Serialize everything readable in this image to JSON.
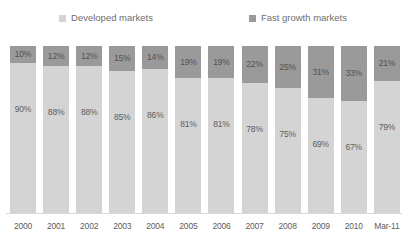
{
  "legend": {
    "position": "top-center",
    "items": [
      {
        "label": "Developed markets",
        "color": "#d4d4d4",
        "swatch_name": "legend-swatch-developed"
      },
      {
        "label": "Fast growth markets",
        "color": "#9a9a9a",
        "swatch_name": "legend-swatch-fast-growth"
      }
    ]
  },
  "colors": {
    "developed_markets": "#d4d4d4",
    "fast_growth_markets": "#9a9a9a",
    "axis_line": "#d9d9d9",
    "label_text": "#5d5d5d",
    "legend_text": "#6e6e6e",
    "background": "#ffffff"
  },
  "chart_data": {
    "type": "bar",
    "stacked": true,
    "normalized_percent": true,
    "title": "",
    "subtitle": "",
    "xlabel": "",
    "ylabel": "",
    "ylim": [
      0,
      100
    ],
    "grid": false,
    "legend_position": "top-center",
    "categories": [
      "2000",
      "2001",
      "2002",
      "2003",
      "2004",
      "2005",
      "2006",
      "2007",
      "2008",
      "2009",
      "2010",
      "Mar-11"
    ],
    "series": [
      {
        "name": "Developed markets",
        "color": "#d4d4d4",
        "values": [
          90,
          88,
          88,
          85,
          86,
          81,
          81,
          78,
          75,
          69,
          67,
          79
        ],
        "labels": [
          "90%",
          "88%",
          "88%",
          "85%",
          "86%",
          "81%",
          "81%",
          "78%",
          "75%",
          "69%",
          "67%",
          "79%"
        ]
      },
      {
        "name": "Fast growth markets",
        "color": "#9a9a9a",
        "values": [
          10,
          12,
          12,
          15,
          14,
          19,
          19,
          22,
          25,
          31,
          33,
          21
        ],
        "labels": [
          "10%",
          "12%",
          "12%",
          "15%",
          "14%",
          "19%",
          "19%",
          "22%",
          "25%",
          "31%",
          "33%",
          "21%"
        ]
      }
    ]
  }
}
